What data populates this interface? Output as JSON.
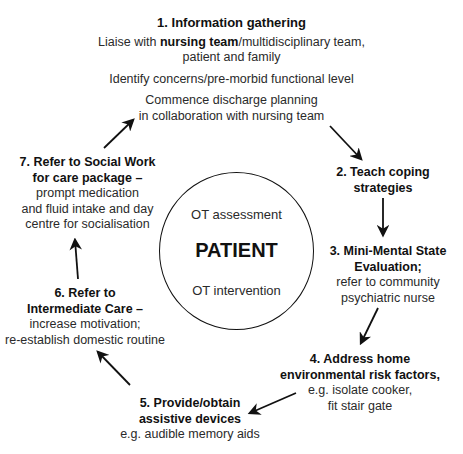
{
  "diagram": {
    "center": {
      "top_label": "OT assessment",
      "main_label": "PATIENT",
      "bottom_label": "OT intervention"
    },
    "steps": [
      {
        "title": "1. Information gathering",
        "lines": [
          {
            "pre": "Liaise with ",
            "bold": "nursing team",
            "post": "/multidisciplinary team,"
          },
          "patient and family",
          "Identify concerns/pre-morbid functional level",
          "Commence discharge planning",
          "in collaboration with nursing team"
        ]
      },
      {
        "title_lines": [
          "2. Teach coping",
          "strategies"
        ],
        "lines": []
      },
      {
        "title_lines": [
          "3. Mini-Mental State",
          "Evaluation;"
        ],
        "lines": [
          "refer to community",
          "psychiatric nurse"
        ]
      },
      {
        "title_lines": [
          "4. Address home",
          "environmental risk factors,"
        ],
        "lines": [
          "e.g. isolate cooker,",
          "fit stair gate"
        ]
      },
      {
        "title_lines": [
          "5. Provide/obtain",
          "assistive devices"
        ],
        "lines": [
          "e.g. audible memory aids"
        ]
      },
      {
        "title_lines": [
          "6. Refer to",
          "Intermediate Care –"
        ],
        "lines": [
          "increase motivation;",
          "re-establish domestic routine"
        ]
      },
      {
        "title_lines": [
          "7. Refer to Social Work",
          "for care package –"
        ],
        "lines": [
          "prompt medication",
          "and fluid intake and day",
          "centre for socialisation"
        ]
      }
    ],
    "arrows": [
      {
        "from": "1",
        "to": "2",
        "x1": 330,
        "y1": 126,
        "x2": 361,
        "y2": 159
      },
      {
        "from": "2",
        "to": "3",
        "x1": 383,
        "y1": 198,
        "x2": 383,
        "y2": 235
      },
      {
        "from": "3",
        "to": "4",
        "x1": 378,
        "y1": 308,
        "x2": 361,
        "y2": 343
      },
      {
        "from": "4",
        "to": "5",
        "x1": 296,
        "y1": 393,
        "x2": 250,
        "y2": 413
      },
      {
        "from": "5",
        "to": "6",
        "x1": 130,
        "y1": 385,
        "x2": 98,
        "y2": 352
      },
      {
        "from": "6",
        "to": "7",
        "x1": 78,
        "y1": 279,
        "x2": 75,
        "y2": 240
      },
      {
        "from": "7",
        "to": "1",
        "x1": 104,
        "y1": 148,
        "x2": 133,
        "y2": 120
      }
    ],
    "colors": {
      "line": "#111111",
      "text": "#1a1a1a",
      "background": "#ffffff"
    }
  }
}
